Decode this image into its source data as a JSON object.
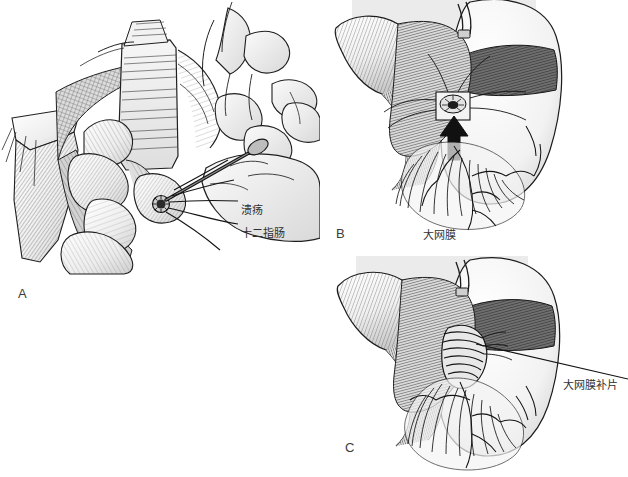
{
  "figure": {
    "background_color": "#ffffff",
    "ink_color": "#1a1a1a",
    "panel_tint_color": "#e9e9e9",
    "width": 628,
    "height": 477
  },
  "panels": [
    {
      "id": "A",
      "letter": "A",
      "caption": "",
      "annotations": [
        {
          "id": "ulcer",
          "text": "溃疡"
        },
        {
          "id": "duodenum",
          "text": "十二指肠"
        }
      ]
    },
    {
      "id": "B",
      "letter": "B",
      "caption": "",
      "annotations": [
        {
          "id": "omentum",
          "text": "大网膜"
        }
      ]
    },
    {
      "id": "C",
      "letter": "C",
      "caption": "",
      "annotations": [
        {
          "id": "omentum_patch",
          "text": "大网膜补片"
        }
      ]
    }
  ]
}
